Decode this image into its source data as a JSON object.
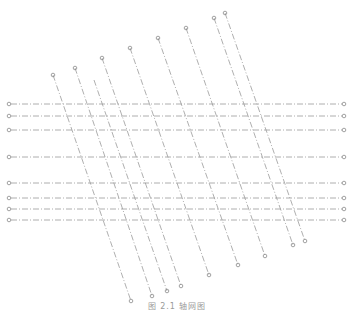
{
  "figure": {
    "caption": "图 2.1  轴网图",
    "line_color": "#9a9a9a",
    "bubble_color": "#8a8a8a",
    "horizontal_axes": [
      {
        "y": 104,
        "x1": 9,
        "x2": 344
      },
      {
        "y": 116,
        "x1": 9,
        "x2": 344
      },
      {
        "y": 130,
        "x1": 9,
        "x2": 344
      },
      {
        "y": 157,
        "x1": 9,
        "x2": 344
      },
      {
        "y": 183,
        "x1": 9,
        "x2": 344
      },
      {
        "y": 198,
        "x1": 9,
        "x2": 344
      },
      {
        "y": 209,
        "x1": 9,
        "x2": 344
      },
      {
        "y": 220,
        "x1": 9,
        "x2": 344
      }
    ],
    "diagonal_axes": [
      {
        "x1": 53,
        "y1": 75,
        "x2": 131,
        "y2": 301,
        "start_bubble": true
      },
      {
        "x1": 75,
        "y1": 68,
        "x2": 152,
        "y2": 296,
        "start_bubble": true
      },
      {
        "x1": 94,
        "y1": 80,
        "x2": 167,
        "y2": 291,
        "start_bubble": false
      },
      {
        "x1": 102,
        "y1": 58,
        "x2": 181,
        "y2": 286,
        "start_bubble": true
      },
      {
        "x1": 130,
        "y1": 48,
        "x2": 209,
        "y2": 275,
        "start_bubble": true
      },
      {
        "x1": 158,
        "y1": 38,
        "x2": 238,
        "y2": 265,
        "start_bubble": true
      },
      {
        "x1": 186,
        "y1": 28,
        "x2": 265,
        "y2": 256,
        "start_bubble": true
      },
      {
        "x1": 214,
        "y1": 18,
        "x2": 293,
        "y2": 245,
        "start_bubble": true
      },
      {
        "x1": 225,
        "y1": 13,
        "x2": 305,
        "y2": 241,
        "start_bubble": true
      }
    ]
  }
}
